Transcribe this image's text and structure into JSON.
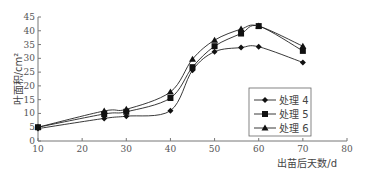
{
  "chart_data": {
    "type": "line",
    "title": "",
    "xlabel": "出苗后天数/d",
    "ylabel": "叶面积/cm²",
    "xlim": [
      10,
      80
    ],
    "ylim": [
      0,
      45
    ],
    "xticks": [
      10,
      20,
      30,
      40,
      50,
      60,
      70,
      80
    ],
    "yticks": [
      0,
      5,
      10,
      15,
      20,
      25,
      30,
      35,
      40,
      45
    ],
    "grid": false,
    "legend_position": "lower right",
    "x": [
      10,
      25,
      30,
      40,
      45,
      50,
      56,
      60,
      70
    ],
    "series": [
      {
        "name": "处理 4",
        "marker": "diamond",
        "values": [
          4.5,
          8.2,
          9.0,
          11.0,
          25.7,
          32.4,
          33.9,
          34.2,
          28.5
        ]
      },
      {
        "name": "处理 5",
        "marker": "square",
        "values": [
          5.0,
          9.8,
          10.6,
          15.6,
          26.8,
          34.4,
          39.0,
          41.7,
          32.7
        ]
      },
      {
        "name": "处理 6",
        "marker": "triangle",
        "values": [
          5.0,
          10.9,
          11.5,
          17.8,
          29.7,
          36.6,
          40.6,
          41.7,
          34.4
        ]
      }
    ]
  }
}
